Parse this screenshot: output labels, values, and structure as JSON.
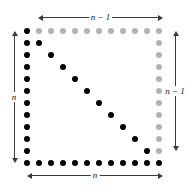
{
  "figure": {
    "background_color": "#ffffff",
    "grid": {
      "rows": 12,
      "cols": 12,
      "origin_x": 27,
      "origin_y": 31,
      "spacing": 12,
      "dot_diameter": 6,
      "black_color": "#000000",
      "gray_color": "#b3b3b3",
      "dots": [
        {
          "row": 0,
          "col": 0,
          "color": "black"
        },
        {
          "row": 0,
          "col": 1,
          "color": "gray"
        },
        {
          "row": 0,
          "col": 2,
          "color": "gray"
        },
        {
          "row": 0,
          "col": 3,
          "color": "gray"
        },
        {
          "row": 0,
          "col": 4,
          "color": "gray"
        },
        {
          "row": 0,
          "col": 5,
          "color": "gray"
        },
        {
          "row": 0,
          "col": 6,
          "color": "gray"
        },
        {
          "row": 0,
          "col": 7,
          "color": "gray"
        },
        {
          "row": 0,
          "col": 8,
          "color": "gray"
        },
        {
          "row": 0,
          "col": 9,
          "color": "gray"
        },
        {
          "row": 0,
          "col": 10,
          "color": "gray"
        },
        {
          "row": 0,
          "col": 11,
          "color": "gray"
        },
        {
          "row": 1,
          "col": 0,
          "color": "black"
        },
        {
          "row": 1,
          "col": 1,
          "color": "black"
        },
        {
          "row": 1,
          "col": 11,
          "color": "gray"
        },
        {
          "row": 2,
          "col": 0,
          "color": "black"
        },
        {
          "row": 2,
          "col": 2,
          "color": "black"
        },
        {
          "row": 2,
          "col": 11,
          "color": "gray"
        },
        {
          "row": 3,
          "col": 0,
          "color": "black"
        },
        {
          "row": 3,
          "col": 3,
          "color": "black"
        },
        {
          "row": 3,
          "col": 11,
          "color": "gray"
        },
        {
          "row": 4,
          "col": 0,
          "color": "black"
        },
        {
          "row": 4,
          "col": 4,
          "color": "black"
        },
        {
          "row": 4,
          "col": 11,
          "color": "gray"
        },
        {
          "row": 5,
          "col": 0,
          "color": "black"
        },
        {
          "row": 5,
          "col": 5,
          "color": "black"
        },
        {
          "row": 5,
          "col": 11,
          "color": "gray"
        },
        {
          "row": 6,
          "col": 0,
          "color": "black"
        },
        {
          "row": 6,
          "col": 6,
          "color": "black"
        },
        {
          "row": 6,
          "col": 11,
          "color": "gray"
        },
        {
          "row": 7,
          "col": 0,
          "color": "black"
        },
        {
          "row": 7,
          "col": 7,
          "color": "black"
        },
        {
          "row": 7,
          "col": 11,
          "color": "gray"
        },
        {
          "row": 8,
          "col": 0,
          "color": "black"
        },
        {
          "row": 8,
          "col": 8,
          "color": "black"
        },
        {
          "row": 8,
          "col": 11,
          "color": "gray"
        },
        {
          "row": 9,
          "col": 0,
          "color": "black"
        },
        {
          "row": 9,
          "col": 9,
          "color": "black"
        },
        {
          "row": 9,
          "col": 11,
          "color": "gray"
        },
        {
          "row": 10,
          "col": 0,
          "color": "black"
        },
        {
          "row": 10,
          "col": 10,
          "color": "black"
        },
        {
          "row": 10,
          "col": 11,
          "color": "gray"
        },
        {
          "row": 11,
          "col": 0,
          "color": "black"
        },
        {
          "row": 11,
          "col": 1,
          "color": "black"
        },
        {
          "row": 11,
          "col": 2,
          "color": "black"
        },
        {
          "row": 11,
          "col": 3,
          "color": "black"
        },
        {
          "row": 11,
          "col": 4,
          "color": "black"
        },
        {
          "row": 11,
          "col": 5,
          "color": "black"
        },
        {
          "row": 11,
          "col": 6,
          "color": "black"
        },
        {
          "row": 11,
          "col": 7,
          "color": "black"
        },
        {
          "row": 11,
          "col": 8,
          "color": "black"
        },
        {
          "row": 11,
          "col": 9,
          "color": "black"
        },
        {
          "row": 11,
          "col": 10,
          "color": "black"
        },
        {
          "row": 11,
          "col": 11,
          "color": "black"
        }
      ]
    },
    "dimensions": {
      "top": {
        "label": "n − 1",
        "orientation": "horizontal",
        "position": "top",
        "x_start": 38,
        "x_end": 163,
        "y": 17
      },
      "left": {
        "label": "n",
        "orientation": "vertical",
        "position": "left",
        "y_start": 31,
        "y_end": 163,
        "x": 14
      },
      "right": {
        "label": "n − 1",
        "orientation": "vertical",
        "position": "right",
        "y_start": 31,
        "y_end": 151,
        "x": 175
      },
      "bottom": {
        "label": "n",
        "orientation": "horizontal",
        "position": "bottom",
        "x_start": 27,
        "x_end": 163,
        "y": 175
      }
    },
    "arrow_color": "#3a3a3a"
  }
}
